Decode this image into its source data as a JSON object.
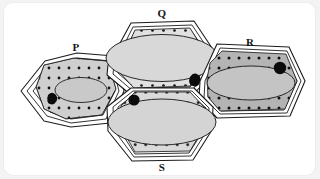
{
  "figure": {
    "background_color": "#f3f3f3",
    "card_color": "#ffffff"
  },
  "palette": {
    "wall_line": "#1c1c1c",
    "wall_fill": "#ffffff",
    "cytoplasm_light": "#e0e0e0",
    "cytoplasm_mid": "#cfcfcf",
    "cytoplasm_dark": "#b4b4b4",
    "vacuole_fill": "#d6d6d6",
    "granule": "#141414",
    "nucleus": "#0b0b0b"
  },
  "cells": [
    {
      "id": "cell-p",
      "label": "P",
      "label_x": 72,
      "label_y": 48,
      "cytoplasm_tone": "#cfcfcf",
      "vacuole_tone": "#c9c9c9",
      "nucleus_shape": "blob",
      "nucleus_position": "left",
      "description": "Left cell, medium size, irregular hexagon, small central vacuole, dark blob nucleus at lower left"
    },
    {
      "id": "cell-q",
      "label": "Q",
      "label_x": 158,
      "label_y": 20,
      "cytoplasm_tone": "#e0e0e0",
      "vacuole_tone": "#d8d8d8",
      "nucleus_shape": "blob",
      "nucleus_position": "right",
      "description": "Top centre cell, large elongated hexagon, very large central vacuole, thin dotted cytoplasm, dark blob nucleus at right"
    },
    {
      "id": "cell-r",
      "label": "R",
      "label_x": 246,
      "label_y": 48,
      "cytoplasm_tone": "#b4b4b4",
      "vacuole_tone": "#c4c4c4",
      "nucleus_shape": "round",
      "nucleus_position": "upper-right",
      "description": "Right cell, darkest dotted cytoplasm, oval vacuole, round dark nucleus upper right"
    },
    {
      "id": "cell-s",
      "label": "S",
      "label_x": 158,
      "label_y": 163,
      "cytoplasm_tone": "#dadada",
      "vacuole_tone": "#d4d4d4",
      "nucleus_shape": "round",
      "nucleus_position": "upper-left",
      "description": "Bottom centre cell, large elongated hexagon, large vacuole, round dark nucleus upper left"
    }
  ],
  "labels": {
    "p": "P",
    "q": "Q",
    "r": "R",
    "s": "S"
  }
}
